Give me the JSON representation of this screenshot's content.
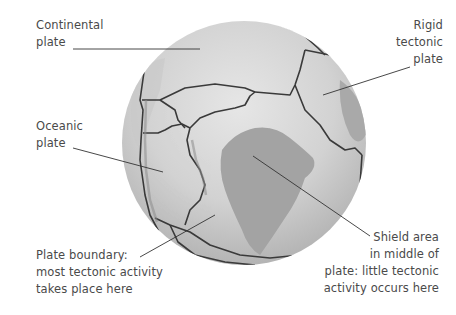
{
  "diagram": {
    "colors": {
      "background": "#ffffff",
      "globe_light": "#e2e2e2",
      "globe_mid": "#c4c4c4",
      "globe_dark": "#a8a8a8",
      "shield": "#9e9e9e",
      "boundary": "#3a3a3a",
      "text": "#4a4a4a",
      "leader_line": "#333333"
    }
  },
  "labels": {
    "continental": {
      "lines": [
        "Continental",
        "plate"
      ]
    },
    "rigid": {
      "lines": [
        "Rigid",
        "tectonic",
        "plate"
      ]
    },
    "oceanic": {
      "lines": [
        "Oceanic",
        "plate"
      ]
    },
    "boundary": {
      "lines": [
        "Plate boundary:",
        "most tectonic activity",
        "takes place here"
      ]
    },
    "shield": {
      "lines": [
        "Shield area",
        "in middle of",
        "plate: little tectonic",
        "activity occurs here"
      ]
    }
  }
}
